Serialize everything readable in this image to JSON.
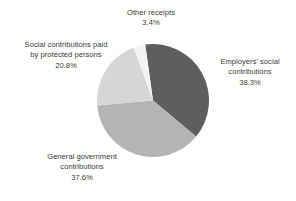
{
  "chart_data": {
    "type": "pie",
    "title": "",
    "subtitle": "",
    "xlabel": "",
    "ylabel": "",
    "grid": false,
    "legend_position": "none",
    "label_style": "outside-callout-text",
    "start_angle_deg": -8,
    "direction": "clockwise",
    "units": "percent",
    "total": 100.1,
    "categories": [
      "Employers' social contributions",
      "General government contributions",
      "Social contributions paid by protected persons",
      "Other receipts"
    ],
    "values": [
      38.3,
      37.6,
      20.8,
      3.4
    ],
    "value_labels": [
      "38.3%",
      "37.6%",
      "20.8%",
      "3.4%"
    ],
    "colors": [
      "#5e5e5e",
      "#b4b4b4",
      "#d6d6d6",
      "#f2f2f2"
    ],
    "slices": [
      {
        "name": "Employers' social contributions",
        "value": 38.3,
        "value_label": "38.3%",
        "color": "#5e5e5e",
        "position": "right"
      },
      {
        "name": "General government contributions",
        "value": 37.6,
        "value_label": "37.6%",
        "color": "#b4b4b4",
        "position": "bottom-left"
      },
      {
        "name": "Social contributions paid by protected persons",
        "value": 20.8,
        "value_label": "20.8%",
        "color": "#d6d6d6",
        "position": "upper-left"
      },
      {
        "name": "Other receipts",
        "value": 3.4,
        "value_label": "3.4%",
        "color": "#f2f2f2",
        "position": "top"
      }
    ]
  },
  "labels": {
    "other_receipts": {
      "line1": "Other receipts",
      "percent": "3.4%"
    },
    "protected_persons": {
      "line1": "Social contributions paid",
      "line2": "by protected persons",
      "percent": "20.8%"
    },
    "employers": {
      "line1": "Employers' social",
      "line2": "contributions",
      "percent": "38.3%"
    },
    "government": {
      "line1": "General government",
      "line2": "contributions",
      "percent": "37.6%"
    }
  },
  "style": {
    "background": "#ffffff",
    "text_color": "#3a3a3a"
  }
}
